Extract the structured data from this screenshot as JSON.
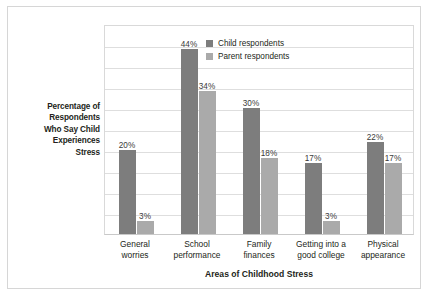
{
  "chart_data": {
    "type": "bar",
    "title": "",
    "xlabel": "Areas of Childhood Stress",
    "ylabel": "Percentage of Respondents Who Say Child Experiences Stress",
    "ylabel_lines": [
      "Percentage of",
      "Respondents",
      "Who Say Child",
      "Experiences",
      "Stress"
    ],
    "categories": [
      "General worries",
      "School performance",
      "Family finances",
      "Getting into a good college",
      "Physical appearance"
    ],
    "category_lines": [
      [
        "General",
        "worries"
      ],
      [
        "School",
        "performance"
      ],
      [
        "Family",
        "finances"
      ],
      [
        "Getting into a",
        "good college"
      ],
      [
        "Physical",
        "appearance"
      ]
    ],
    "series": [
      {
        "name": "Child respondents",
        "color": "#7d7d7d",
        "values": [
          20,
          44,
          30,
          17,
          22
        ],
        "labels": [
          "20%",
          "44%",
          "30%",
          "17%",
          "22%"
        ]
      },
      {
        "name": "Parent respondents",
        "color": "#aaaaaa",
        "values": [
          3,
          34,
          18,
          3,
          17
        ],
        "labels": [
          "3%",
          "34%",
          "18%",
          "3%",
          "17%"
        ]
      }
    ],
    "ylim": [
      0,
      50
    ],
    "ytick_interval": 5,
    "yticks": [
      0,
      5,
      10,
      15,
      20,
      25,
      30,
      35,
      40,
      45,
      50
    ],
    "grid": true,
    "grid_axis": "y",
    "ytick_labels_visible": false,
    "legend_position": "top-right inside plot"
  },
  "legend": {
    "items": [
      {
        "label": "Child respondents",
        "swatch": "child"
      },
      {
        "label": "Parent respondents",
        "swatch": "parent"
      }
    ]
  },
  "axis_titles": {
    "x": "Areas of Childhood Stress"
  },
  "colors": {
    "child_series": "#7d7d7d",
    "parent_series": "#aaaaaa",
    "gridline": "#dedede",
    "plot_border": "#d9d9d9",
    "frame_border": "#d6d6d6",
    "text": "#231f20",
    "label_text": "#3a3a3a",
    "background": "#ffffff"
  }
}
